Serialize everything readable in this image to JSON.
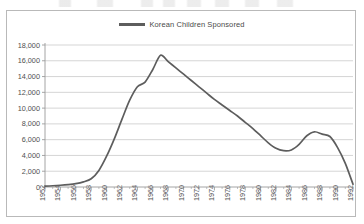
{
  "legend": {
    "series_label": "Korean Children Sponsored",
    "position": "top-center",
    "swatch_color": "#5d5d5d"
  },
  "axes": {
    "y_ticks": [
      "0",
      "2,000",
      "4,000",
      "6,000",
      "8,000",
      "10,000",
      "12,000",
      "14,000",
      "16,000",
      "18,000"
    ],
    "x_ticks": [
      "1952",
      "1954",
      "1956",
      "1958",
      "1960",
      "1962",
      "1964",
      "1966",
      "1968",
      "1970",
      "1972",
      "1974",
      "1976",
      "1978",
      "1980",
      "1982",
      "1984",
      "1986",
      "1988",
      "1990",
      "1992"
    ]
  },
  "chart_data": {
    "type": "line",
    "title": "",
    "subtitle": "",
    "xlabel": "",
    "ylabel": "",
    "xlim": [
      1952,
      1992
    ],
    "ylim": [
      0,
      18000
    ],
    "ytick_interval": 2000,
    "xtick_label_interval": 2,
    "xtick_minor_interval": 1,
    "grid": "horizontal",
    "legend_position": "top-center",
    "series": [
      {
        "name": "Korean Children Sponsored",
        "color": "#5d5d5d",
        "x": [
          1952,
          1953,
          1954,
          1955,
          1956,
          1957,
          1958,
          1959,
          1960,
          1961,
          1962,
          1963,
          1964,
          1965,
          1966,
          1967,
          1968,
          1969,
          1970,
          1971,
          1972,
          1973,
          1974,
          1975,
          1976,
          1977,
          1978,
          1979,
          1980,
          1981,
          1982,
          1983,
          1984,
          1985,
          1986,
          1987,
          1988,
          1989,
          1990,
          1991,
          1992
        ],
        "values": [
          120,
          160,
          220,
          300,
          420,
          650,
          1050,
          2100,
          3900,
          6100,
          8600,
          11000,
          12700,
          13300,
          14900,
          16700,
          15900,
          15100,
          14300,
          13500,
          12700,
          11900,
          11100,
          10400,
          9700,
          9000,
          8200,
          7400,
          6500,
          5600,
          4900,
          4600,
          4700,
          5400,
          6500,
          7000,
          6700,
          6400,
          5000,
          3000,
          350
        ]
      }
    ],
    "annotations": {
      "peak_year": 1967,
      "peak_value": 16700,
      "trough_year": 1983,
      "trough_value": 4600,
      "secondary_peak_year": 1987,
      "secondary_peak_value": 7000,
      "final_year": 1992,
      "final_value": 350
    }
  },
  "colors": {
    "line": "#5d5d5d",
    "grid": "#c3c3c3",
    "axis": "#9a9a9a",
    "frame_border": "#b9b9b9",
    "background": "#ffffff",
    "text": "#4f4f4f"
  }
}
